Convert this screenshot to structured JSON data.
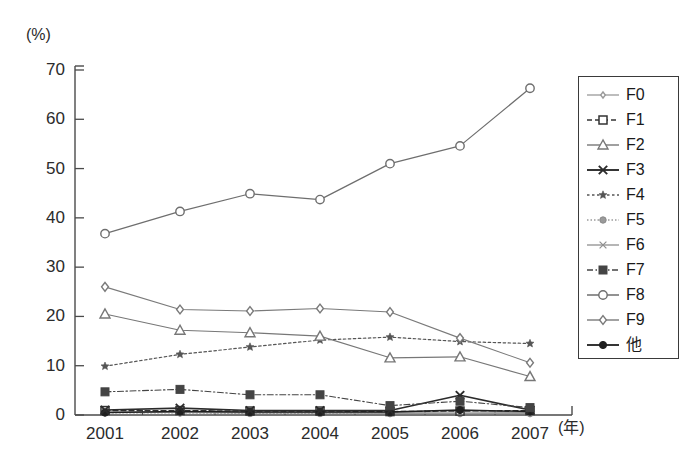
{
  "axes": {
    "y_unit_label": "(%)",
    "x_unit_label": "(年)",
    "y_ticks": [
      "0",
      "10",
      "20",
      "30",
      "40",
      "50",
      "60",
      "70"
    ],
    "x_ticks": [
      "2001",
      "2002",
      "2003",
      "2004",
      "2005",
      "2006",
      "2007"
    ]
  },
  "legend": {
    "items": [
      {
        "label": "F0",
        "marker": "open-diamond-small-icon",
        "dash": "solid-light"
      },
      {
        "label": "F1",
        "marker": "open-square-icon",
        "dash": "dashed"
      },
      {
        "label": "F2",
        "marker": "open-triangle-icon",
        "dash": "solid-light"
      },
      {
        "label": "F3",
        "marker": "x-cross-icon",
        "dash": "solid-bold"
      },
      {
        "label": "F4",
        "marker": "star-icon",
        "dash": "dotted"
      },
      {
        "label": "F5",
        "marker": "filled-circle-gray-icon",
        "dash": "dotted-fine"
      },
      {
        "label": "F6",
        "marker": "x-cross-light-icon",
        "dash": "solid-light"
      },
      {
        "label": "F7",
        "marker": "filled-square-icon",
        "dash": "dash-dot"
      },
      {
        "label": "F8",
        "marker": "open-circle-icon",
        "dash": "solid-light"
      },
      {
        "label": "F9",
        "marker": "open-diamond-icon",
        "dash": "solid-light"
      },
      {
        "label": "他",
        "marker": "filled-circle-icon",
        "dash": "solid-bold"
      }
    ]
  },
  "chart_data": {
    "type": "line",
    "title": "",
    "xlabel": "(年)",
    "ylabel": "(%)",
    "x": [
      2001,
      2002,
      2003,
      2004,
      2005,
      2006,
      2007
    ],
    "categories": [
      "2001",
      "2002",
      "2003",
      "2004",
      "2005",
      "2006",
      "2007"
    ],
    "ylim": [
      0,
      70
    ],
    "yticks": [
      0,
      10,
      20,
      30,
      40,
      50,
      60,
      70
    ],
    "grid": false,
    "legend_position": "right",
    "series": [
      {
        "name": "F0",
        "values": [
          0.6,
          0.5,
          0.4,
          0.4,
          0.3,
          0.3,
          0.3
        ]
      },
      {
        "name": "F1",
        "values": [
          0.9,
          0.9,
          0.8,
          0.8,
          0.7,
          0.8,
          0.9
        ]
      },
      {
        "name": "F2",
        "values": [
          20.5,
          17.2,
          16.7,
          16.0,
          11.6,
          11.8,
          7.8
        ]
      },
      {
        "name": "F3",
        "values": [
          1.0,
          1.4,
          0.9,
          0.9,
          0.9,
          4.0,
          1.0
        ]
      },
      {
        "name": "F4",
        "values": [
          9.9,
          12.3,
          13.8,
          15.2,
          15.8,
          14.9,
          14.5
        ]
      },
      {
        "name": "F5",
        "values": [
          0.4,
          0.4,
          0.3,
          0.3,
          0.3,
          0.3,
          0.3
        ]
      },
      {
        "name": "F6",
        "values": [
          0.5,
          0.6,
          0.5,
          0.5,
          0.5,
          0.6,
          0.5
        ]
      },
      {
        "name": "F7",
        "values": [
          4.7,
          5.2,
          4.1,
          4.1,
          1.9,
          2.8,
          1.5
        ]
      },
      {
        "name": "F8",
        "values": [
          36.8,
          41.3,
          44.9,
          43.7,
          51.0,
          54.6,
          66.3
        ]
      },
      {
        "name": "F9",
        "values": [
          26.0,
          21.4,
          21.1,
          21.6,
          20.9,
          15.6,
          10.6
        ]
      },
      {
        "name": "他",
        "values": [
          0.5,
          0.7,
          0.6,
          0.6,
          0.6,
          1.0,
          0.7
        ]
      }
    ]
  }
}
